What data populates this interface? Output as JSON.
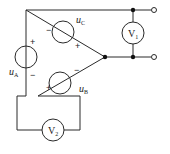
{
  "diagram": {
    "type": "circuit",
    "colors": {
      "wire": "#2a2a2a",
      "background": "#ffffff"
    },
    "sources": [
      {
        "id": "uA",
        "label": "u",
        "subscript": "A",
        "plus": "+",
        "minus": "−"
      },
      {
        "id": "uB",
        "label": "u",
        "subscript": "B",
        "plus": "+",
        "minus": "−"
      },
      {
        "id": "uC",
        "label": "u",
        "subscript": "C",
        "plus": "+",
        "minus": "−"
      }
    ],
    "meters": [
      {
        "id": "V1",
        "label": "V",
        "subscript": "1"
      },
      {
        "id": "V2",
        "label": "V",
        "subscript": "2"
      }
    ],
    "terminals": 2,
    "junctions": 3
  }
}
